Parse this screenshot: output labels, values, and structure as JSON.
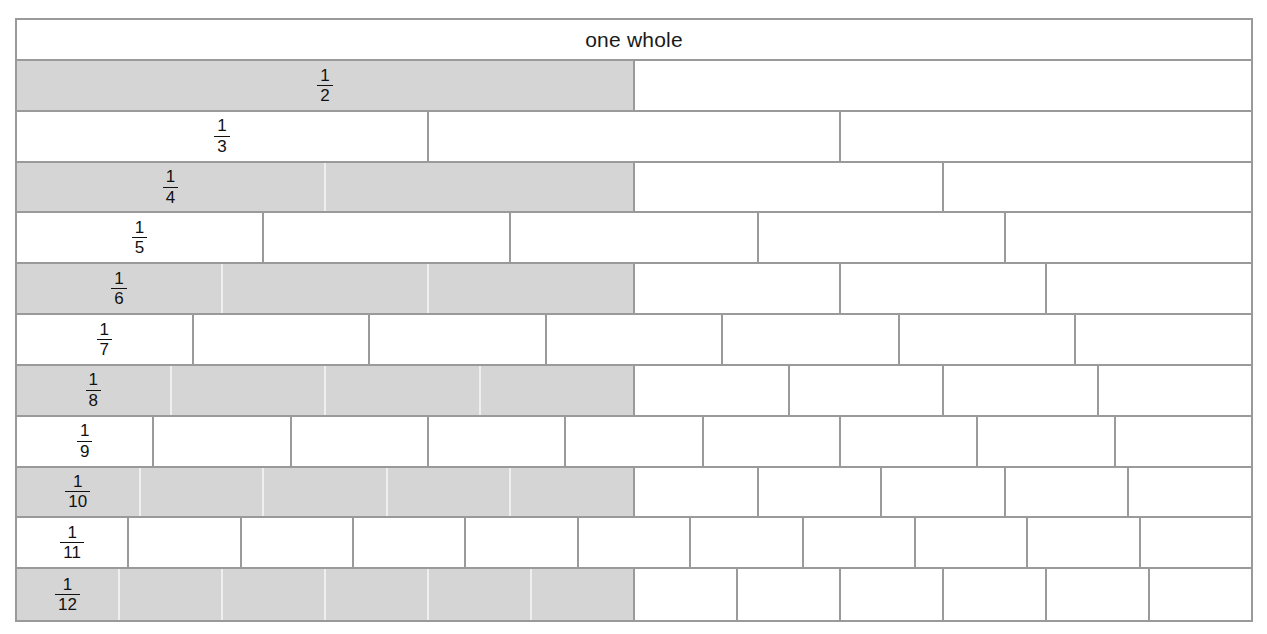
{
  "header": {
    "label": "one whole"
  },
  "colors": {
    "shaded_fill": "#d5d5d5",
    "unshaded_fill": "#ffffff",
    "border": "#9a9a9a",
    "text": "#111111",
    "light_divider": "#efefef"
  },
  "chart_data": {
    "type": "bar",
    "title": "one whole",
    "xlabel": "",
    "ylabel": "",
    "grid": false,
    "legend": null,
    "total_width_fraction": 1.0,
    "categories": [
      "1/2",
      "1/3",
      "1/4",
      "1/5",
      "1/6",
      "1/7",
      "1/8",
      "1/9",
      "1/10",
      "1/11",
      "1/12"
    ],
    "values": [
      0.5,
      0.3333,
      0.25,
      0.2,
      0.1667,
      0.1429,
      0.125,
      0.1111,
      0.1,
      0.0909,
      0.0833
    ]
  },
  "rows": [
    {
      "id": "row-whole",
      "denominator": 1,
      "label": "one whole",
      "label_kind": "text",
      "numerator": "",
      "shaded_count": 0,
      "cells": 1
    },
    {
      "id": "row-half",
      "denominator": 2,
      "label": "1/2",
      "label_kind": "fraction",
      "numerator": "1",
      "shaded_count": 1,
      "cells": 2
    },
    {
      "id": "row-third",
      "denominator": 3,
      "label": "1/3",
      "label_kind": "fraction",
      "numerator": "1",
      "shaded_count": 0,
      "cells": 3
    },
    {
      "id": "row-quarter",
      "denominator": 4,
      "label": "1/4",
      "label_kind": "fraction",
      "numerator": "1",
      "shaded_count": 2,
      "cells": 4
    },
    {
      "id": "row-fifth",
      "denominator": 5,
      "label": "1/5",
      "label_kind": "fraction",
      "numerator": "1",
      "shaded_count": 0,
      "cells": 5
    },
    {
      "id": "row-sixth",
      "denominator": 6,
      "label": "1/6",
      "label_kind": "fraction",
      "numerator": "1",
      "shaded_count": 3,
      "cells": 6
    },
    {
      "id": "row-seventh",
      "denominator": 7,
      "label": "1/7",
      "label_kind": "fraction",
      "numerator": "1",
      "shaded_count": 0,
      "cells": 7
    },
    {
      "id": "row-eighth",
      "denominator": 8,
      "label": "1/8",
      "label_kind": "fraction",
      "numerator": "1",
      "shaded_count": 4,
      "cells": 8
    },
    {
      "id": "row-ninth",
      "denominator": 9,
      "label": "1/9",
      "label_kind": "fraction",
      "numerator": "1",
      "shaded_count": 0,
      "cells": 9
    },
    {
      "id": "row-tenth",
      "denominator": 10,
      "label": "1/10",
      "label_kind": "fraction",
      "numerator": "1",
      "shaded_count": 5,
      "cells": 10
    },
    {
      "id": "row-eleventh",
      "denominator": 11,
      "label": "1/11",
      "label_kind": "fraction",
      "numerator": "1",
      "shaded_count": 0,
      "cells": 11
    },
    {
      "id": "row-twelfth",
      "denominator": 12,
      "label": "1/12",
      "label_kind": "fraction",
      "numerator": "1",
      "shaded_count": 6,
      "cells": 12
    }
  ]
}
